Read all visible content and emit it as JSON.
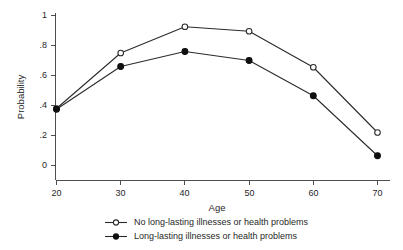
{
  "chart_data": {
    "type": "line",
    "title": "",
    "subtitle": "",
    "xlabel": "Age",
    "ylabel": "Probability",
    "x": [
      20,
      30,
      40,
      50,
      60,
      70
    ],
    "xlim": [
      20,
      70
    ],
    "ylim": [
      0,
      1
    ],
    "xticks": [
      "20",
      "30",
      "40",
      "50",
      "60",
      "70"
    ],
    "yticks": [
      "0",
      ".2",
      ".4",
      ".6",
      ".8",
      "1"
    ],
    "ytick_values": [
      0,
      0.2,
      0.4,
      0.6,
      0.8,
      1
    ],
    "grid": false,
    "legend_position": "bottom",
    "series": [
      {
        "name": "No long-lasting illnesses or health problems",
        "marker": "open-circle",
        "color": "#2b2b2b",
        "values": [
          0.38,
          0.75,
          0.925,
          0.895,
          0.655,
          0.22
        ]
      },
      {
        "name": "Long-lasting illnesses or health problems",
        "marker": "filled-circle",
        "color": "#101010",
        "values": [
          0.375,
          0.66,
          0.76,
          0.7,
          0.465,
          0.065
        ]
      }
    ]
  },
  "axis": {
    "x_title": "Age",
    "y_title": "Probability",
    "x_tick_labels": [
      "20",
      "30",
      "40",
      "50",
      "60",
      "70"
    ],
    "y_tick_labels": [
      "0",
      ".2",
      ".4",
      ".6",
      ".8",
      "1"
    ]
  },
  "legend": {
    "entries": [
      {
        "label": "No long-lasting illnesses or health problems",
        "marker": "open-circle"
      },
      {
        "label": "Long-lasting illnesses or health problems",
        "marker": "filled-circle"
      }
    ]
  },
  "colors": {
    "background": "#ffffff",
    "axis": "#3c3c3c",
    "series_open": "#2b2b2b",
    "series_filled": "#101010",
    "text": "#1f1f1f"
  }
}
